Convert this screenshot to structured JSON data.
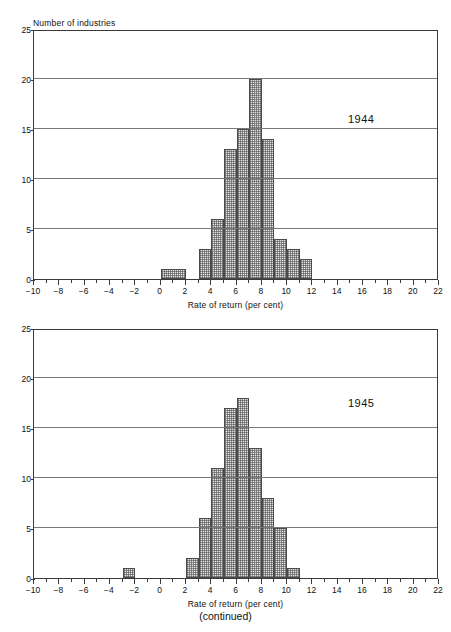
{
  "page": {
    "faint_header": "",
    "caption": "(continued)"
  },
  "axes": {
    "ylabel": "Number of industries",
    "xlabel": "Rate of return (per cent)",
    "y_ticks": [
      0,
      5,
      10,
      15,
      20,
      25
    ],
    "x_ticks": [
      -10,
      -8,
      -6,
      -4,
      -2,
      0,
      2,
      4,
      6,
      8,
      10,
      12,
      14,
      16,
      18,
      20,
      22
    ],
    "xlim": [
      -10,
      22
    ],
    "ylim": [
      0,
      25
    ]
  },
  "colors": {
    "axis": "#3a3a3a",
    "grid": "#7a7a7a",
    "bar_fill": "#e3e3e3",
    "bar_edge": "#4a4a4a",
    "text": "#111111"
  },
  "chart_data": [
    {
      "type": "bar",
      "title": "1944",
      "xlabel": "Rate of return (per cent)",
      "ylabel": "Number of industries",
      "xlim": [
        -10,
        22
      ],
      "ylim": [
        0,
        25
      ],
      "grid": true,
      "legend": "none",
      "bins": [
        {
          "x0": 0,
          "x1": 2,
          "value": 1
        },
        {
          "x0": 3,
          "x1": 4,
          "value": 3
        },
        {
          "x0": 4,
          "x1": 5,
          "value": 6
        },
        {
          "x0": 5,
          "x1": 6,
          "value": 13
        },
        {
          "x0": 6,
          "x1": 7,
          "value": 15
        },
        {
          "x0": 7,
          "x1": 8,
          "value": 20
        },
        {
          "x0": 8,
          "x1": 9,
          "value": 14
        },
        {
          "x0": 9,
          "x1": 10,
          "value": 4
        },
        {
          "x0": 10,
          "x1": 11,
          "value": 3
        },
        {
          "x0": 11,
          "x1": 12,
          "value": 2
        }
      ]
    },
    {
      "type": "bar",
      "title": "1945",
      "xlabel": "Rate of return (per cent)",
      "ylabel": "Number of industries",
      "xlim": [
        -10,
        22
      ],
      "ylim": [
        0,
        25
      ],
      "grid": true,
      "legend": "none",
      "bins": [
        {
          "x0": -3,
          "x1": -2,
          "value": 1
        },
        {
          "x0": 2,
          "x1": 3,
          "value": 2
        },
        {
          "x0": 3,
          "x1": 4,
          "value": 6
        },
        {
          "x0": 4,
          "x1": 5,
          "value": 11
        },
        {
          "x0": 5,
          "x1": 6,
          "value": 17
        },
        {
          "x0": 6,
          "x1": 7,
          "value": 18
        },
        {
          "x0": 7,
          "x1": 8,
          "value": 13
        },
        {
          "x0": 8,
          "x1": 9,
          "value": 8
        },
        {
          "x0": 9,
          "x1": 10,
          "value": 5
        },
        {
          "x0": 10,
          "x1": 11,
          "value": 1
        }
      ]
    }
  ]
}
